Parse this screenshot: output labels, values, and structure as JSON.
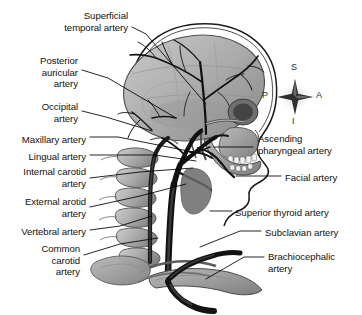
{
  "figure": {
    "view": "left lateral",
    "background_color": "#ffffff",
    "line_color": "#000000",
    "text_color": "#111111"
  },
  "orientation_compass": {
    "name": "anatomical-orientation-indicator",
    "center": {
      "x": 295,
      "y": 97
    },
    "superior": "S",
    "inferior": "I",
    "anterior": "A",
    "posterior": "P"
  },
  "labels_left": [
    {
      "text": "Superficial\ntemporal artery",
      "x": 16,
      "y": 10,
      "width": 112,
      "align": "right"
    },
    {
      "text": "Posterior\nauricular\nartery",
      "x": 12,
      "y": 55,
      "width": 66,
      "align": "right"
    },
    {
      "text": "Occipital\nartery",
      "x": 12,
      "y": 101,
      "width": 66,
      "align": "right"
    },
    {
      "text": "Maxillary artery",
      "x": 4,
      "y": 134,
      "width": 82,
      "align": "right"
    },
    {
      "text": "Lingual artery",
      "x": 4,
      "y": 151,
      "width": 82,
      "align": "right"
    },
    {
      "text": "Internal carotid\nartery",
      "x": 4,
      "y": 166,
      "width": 82,
      "align": "right"
    },
    {
      "text": "External arotid\nartery",
      "x": 4,
      "y": 196,
      "width": 82,
      "align": "right"
    },
    {
      "text": "Vertebral artery",
      "x": 4,
      "y": 226,
      "width": 82,
      "align": "right"
    },
    {
      "text": "Common\ncarotid\nartery",
      "x": 14,
      "y": 243,
      "width": 66,
      "align": "right"
    }
  ],
  "labels_right": [
    {
      "text": "Ascending\npharyngeal artery",
      "x": 258,
      "y": 133,
      "width": 100,
      "align": "left"
    },
    {
      "text": "Facial artery",
      "x": 285,
      "y": 172,
      "width": 76,
      "align": "left"
    },
    {
      "text": "Superior thyroid artery",
      "x": 235,
      "y": 207,
      "width": 126,
      "align": "left"
    },
    {
      "text": "Subclavian artery",
      "x": 265,
      "y": 227,
      "width": 96,
      "align": "left"
    },
    {
      "text": "Brachiocephalic\nartery",
      "x": 268,
      "y": 251,
      "width": 92,
      "align": "left"
    }
  ],
  "leader_lines": [
    {
      "name": "leader-superficial-temporal",
      "points": "132,27 146,34 206,104"
    },
    {
      "name": "leader-posterior-auricular",
      "points": "82,70 108,78 176,118"
    },
    {
      "name": "leader-occipital",
      "points": "82,111 106,117 152,131"
    },
    {
      "name": "leader-maxillary",
      "points": "90,137 118,137 193,152"
    },
    {
      "name": "leader-lingual",
      "points": "90,155 155,155 196,161"
    },
    {
      "name": "leader-internal-carotid",
      "points": "90,178 140,172 193,168"
    },
    {
      "name": "leader-external-carotid",
      "points": "90,207 140,196 186,184"
    },
    {
      "name": "leader-vertebral",
      "points": "90,230 120,226 152,216"
    },
    {
      "name": "leader-common-carotid",
      "points": "84,255 120,244 158,238"
    },
    {
      "name": "leader-ascending-pharyngeal",
      "points": "253,147 238,147 214,147"
    },
    {
      "name": "leader-facial",
      "points": "281,176 252,176 236,176"
    },
    {
      "name": "leader-superior-thyroid",
      "points": "232,211 222,211 210,211"
    },
    {
      "name": "leader-subclavian",
      "points": "261,231 240,231 200,247"
    },
    {
      "name": "leader-brachiocephalic",
      "points": "264,257 244,257 206,279"
    }
  ],
  "anatomy_parts": [
    {
      "name": "cranium-outline",
      "kind": "bone"
    },
    {
      "name": "scalp-outline",
      "kind": "soft-tissue"
    },
    {
      "name": "facial-skeleton",
      "kind": "bone"
    },
    {
      "name": "mandible",
      "kind": "bone"
    },
    {
      "name": "maxillary-teeth",
      "kind": "bone"
    },
    {
      "name": "cervical-vertebrae",
      "kind": "bone"
    },
    {
      "name": "clavicle",
      "kind": "bone"
    },
    {
      "name": "first-rib",
      "kind": "bone"
    },
    {
      "name": "scapula-fragment",
      "kind": "bone"
    },
    {
      "name": "cranial-arterial-network",
      "kind": "artery"
    },
    {
      "name": "common-carotid-trunk",
      "kind": "artery"
    },
    {
      "name": "carotid-bifurcation",
      "kind": "artery"
    },
    {
      "name": "vertebral-artery-column",
      "kind": "artery"
    },
    {
      "name": "subclavian-artery",
      "kind": "artery"
    },
    {
      "name": "brachiocephalic-trunk",
      "kind": "artery"
    }
  ]
}
